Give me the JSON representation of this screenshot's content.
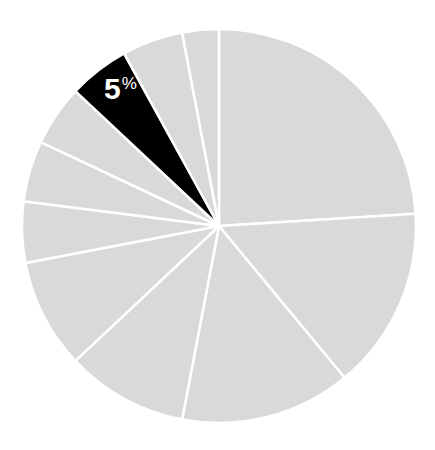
{
  "chart_data": {
    "type": "pie",
    "title": "",
    "categories": [
      "Slice 1",
      "Slice 2",
      "Slice 3",
      "Slice 4",
      "Slice 5",
      "Slice 6",
      "Slice 7",
      "Slice 8",
      "Slice 9",
      "Slice 10",
      "Slice 11"
    ],
    "values": [
      24,
      15,
      14,
      10,
      9,
      5,
      5,
      5,
      5,
      5,
      3
    ],
    "start_angle_deg": 0,
    "direction": "clockwise",
    "highlighted_index": 8,
    "labels": [
      {
        "index": 8,
        "number": "5",
        "suffix": "%"
      }
    ],
    "legend": "none",
    "colors": {
      "default": "#d9d9d9",
      "highlight": "#000000",
      "separator": "#ffffff",
      "label_text": "#ffffff"
    }
  },
  "highlight_label": {
    "number": "5",
    "suffix": "%"
  }
}
